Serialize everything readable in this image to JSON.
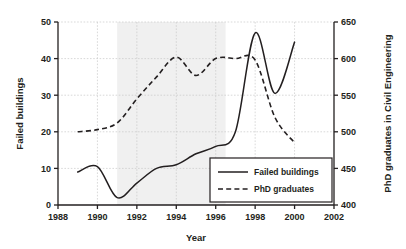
{
  "chart_data": {
    "type": "line",
    "title": "",
    "xlabel": "Year",
    "ylabel": "Failed buildings",
    "y2label": "PhD graduates in Civil Engineering",
    "xlim": [
      1988,
      2002
    ],
    "ylim": [
      0,
      50
    ],
    "y2lim": [
      400,
      650
    ],
    "xticks": [
      1988,
      1990,
      1992,
      1994,
      1996,
      1998,
      2000,
      2002
    ],
    "yticks": [
      0,
      10,
      20,
      30,
      40,
      50
    ],
    "y2ticks": [
      400,
      450,
      500,
      550,
      600,
      650
    ],
    "grid": true,
    "legend_position": "lower right",
    "shaded_band": [
      1991,
      1996.5
    ],
    "series": [
      {
        "name": "Failed buildings",
        "axis": "left",
        "style": "solid",
        "color": "#231f20",
        "x": [
          1989,
          1990,
          1991,
          1992,
          1993,
          1994,
          1995,
          1996,
          1997,
          1998,
          1999,
          2000
        ],
        "values": [
          9,
          10.5,
          2,
          6,
          10,
          11,
          14,
          16,
          20,
          47,
          30.5,
          44.5
        ]
      },
      {
        "name": "PhD graduates",
        "axis": "right",
        "style": "dashed",
        "color": "#231f20",
        "x": [
          1989,
          1990,
          1991,
          1992,
          1993,
          1994,
          1995,
          1996,
          1997,
          1998,
          1999,
          2000
        ],
        "values": [
          500,
          503,
          512,
          545,
          575,
          602,
          577,
          600,
          600,
          598,
          520,
          485
        ],
        "values_left_scale": [
          20,
          20.6,
          22.4,
          29,
          35,
          40.4,
          35.4,
          40,
          40,
          39.6,
          24,
          17
        ]
      }
    ]
  },
  "axes": {
    "y_tick_labels": [
      "50",
      "40",
      "30",
      "20",
      "10",
      "0"
    ],
    "y2_tick_labels": [
      "650",
      "600",
      "550",
      "500",
      "450",
      "400"
    ],
    "x_tick_labels": [
      "1988",
      "1990",
      "1992",
      "1994",
      "1996",
      "1998",
      "2000",
      "2002"
    ],
    "y_title": "Failed buildings",
    "y2_title": "PhD graduates in Civil Engineering",
    "x_title": "Year"
  },
  "legend": {
    "entries": [
      {
        "label": "Failed buildings",
        "style": "solid"
      },
      {
        "label": "PhD graduates",
        "style": "dashed"
      }
    ]
  },
  "colors": {
    "line": "#231f20",
    "grid": "#c8c8c8",
    "band": "#f0f0f0",
    "text": "#231f20",
    "background": "#ffffff"
  }
}
